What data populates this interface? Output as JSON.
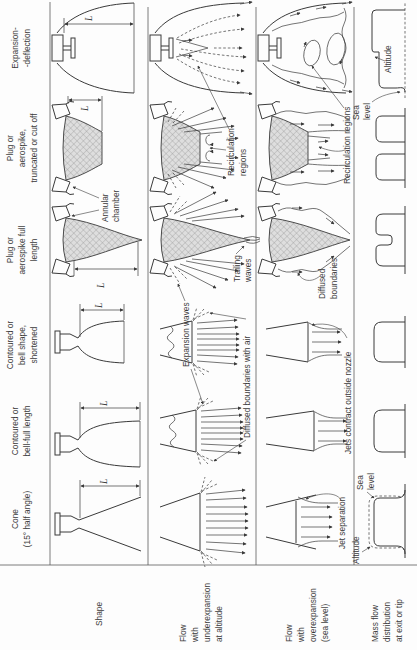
{
  "figure": {
    "colors": {
      "ink": "#3a3a3a",
      "grid": "#5a5a5a",
      "background": "#fdfdfd",
      "hatch_fill": "#dedede",
      "hatch_line": "#909090"
    },
    "columns": [
      {
        "id": "cone",
        "lines": [
          "Cone",
          "(15° half angle)"
        ]
      },
      {
        "id": "bell_full",
        "lines": [
          "Contoured or",
          "bell-full length"
        ]
      },
      {
        "id": "bell_short",
        "lines": [
          "Contoured or",
          "bell shape,",
          "shortened"
        ]
      },
      {
        "id": "plug_full",
        "lines": [
          "Plug or",
          "aerospike full",
          "length"
        ]
      },
      {
        "id": "plug_trunc",
        "lines": [
          "Plug or",
          "aerospike,",
          "truncated or cut off"
        ]
      },
      {
        "id": "exp_defl",
        "lines": [
          "Expansion-",
          "-deflection"
        ]
      }
    ],
    "rows": [
      {
        "id": "shape",
        "lines": [
          "Shape"
        ]
      },
      {
        "id": "underexpansion",
        "lines": [
          "Flow",
          "with",
          "underexpansion",
          "at altitude"
        ]
      },
      {
        "id": "overexpansion",
        "lines": [
          "Flow",
          "with",
          "overexpansion",
          "(sea level)"
        ]
      },
      {
        "id": "mass_flow",
        "lines": [
          "Mass flow",
          "distribution",
          "at exit or tip"
        ]
      }
    ],
    "annotations": {
      "dim_l": "L",
      "annular_chamber": [
        "Annular",
        "chamber"
      ],
      "expansion_waves": "Expansion waves",
      "diffused_boundaries_air": "Diffused boundaries with air",
      "trailing_waves": [
        "Trailing",
        "waves"
      ],
      "recirculation_under": [
        "Recirculation",
        "regions"
      ],
      "jet_separation": "Jet separation",
      "jets_contract": "Jets contract outside nozzle",
      "diffused_boundaries": [
        "Diffused",
        "boundaries"
      ],
      "recirculation_over": "Recirculation regions",
      "altitude": "Altitude",
      "sea_level": [
        "Sea",
        "level"
      ]
    }
  }
}
